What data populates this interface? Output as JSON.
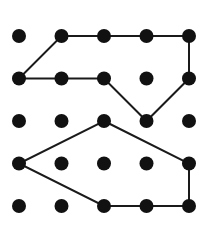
{
  "figure": {
    "type": "dot-grid-polygon-diagram",
    "canvas": {
      "width": 205,
      "height": 236,
      "background_color": "#ffffff"
    },
    "grid": {
      "rows": 5,
      "columns": 5,
      "origin_x": 19,
      "origin_y": 36,
      "spacing_x": 42.5,
      "spacing_y": 42.5,
      "dot_radius": 7,
      "dot_color": "#111111",
      "column_centers": [
        19,
        61.5,
        104,
        146.5,
        189
      ],
      "row_centers": [
        36,
        78.5,
        121,
        163.5,
        206
      ]
    },
    "stroke": {
      "color": "#1a1a1a",
      "width": 2,
      "linejoin": "miter",
      "linecap": "butt"
    },
    "shapes": [
      {
        "name": "upper-polygon",
        "closed": true,
        "fill": "none",
        "vertices_grid": [
          [
            1,
            0
          ],
          [
            4,
            0
          ],
          [
            4,
            1
          ],
          [
            3,
            2
          ],
          [
            2,
            1
          ],
          [
            0,
            1
          ]
        ],
        "vertices_px": [
          [
            61.5,
            36
          ],
          [
            189,
            36
          ],
          [
            189,
            78.5
          ],
          [
            146.5,
            121
          ],
          [
            104,
            78.5
          ],
          [
            19,
            78.5
          ]
        ],
        "vertex_count": 6
      },
      {
        "name": "lower-polygon",
        "closed": true,
        "fill": "none",
        "vertices_grid": [
          [
            2,
            2
          ],
          [
            4,
            3
          ],
          [
            4,
            4
          ],
          [
            2,
            4
          ],
          [
            0,
            3
          ]
        ],
        "vertices_px": [
          [
            104,
            121
          ],
          [
            189,
            163.5
          ],
          [
            189,
            206
          ],
          [
            104,
            206
          ],
          [
            19,
            163.5
          ]
        ],
        "vertex_count": 5
      }
    ],
    "dots": [
      {
        "grid": [
          0,
          0
        ],
        "px": [
          19,
          36
        ]
      },
      {
        "grid": [
          1,
          0
        ],
        "px": [
          61.5,
          36
        ]
      },
      {
        "grid": [
          2,
          0
        ],
        "px": [
          104,
          36
        ]
      },
      {
        "grid": [
          3,
          0
        ],
        "px": [
          146.5,
          36
        ]
      },
      {
        "grid": [
          4,
          0
        ],
        "px": [
          189,
          36
        ]
      },
      {
        "grid": [
          0,
          1
        ],
        "px": [
          19,
          78.5
        ]
      },
      {
        "grid": [
          1,
          1
        ],
        "px": [
          61.5,
          78.5
        ]
      },
      {
        "grid": [
          2,
          1
        ],
        "px": [
          104,
          78.5
        ]
      },
      {
        "grid": [
          3,
          1
        ],
        "px": [
          146.5,
          78.5
        ]
      },
      {
        "grid": [
          4,
          1
        ],
        "px": [
          189,
          78.5
        ]
      },
      {
        "grid": [
          0,
          2
        ],
        "px": [
          19,
          121
        ]
      },
      {
        "grid": [
          1,
          2
        ],
        "px": [
          61.5,
          121
        ]
      },
      {
        "grid": [
          2,
          2
        ],
        "px": [
          104,
          121
        ]
      },
      {
        "grid": [
          3,
          2
        ],
        "px": [
          146.5,
          121
        ]
      },
      {
        "grid": [
          4,
          2
        ],
        "px": [
          189,
          121
        ]
      },
      {
        "grid": [
          0,
          3
        ],
        "px": [
          19,
          163.5
        ]
      },
      {
        "grid": [
          1,
          3
        ],
        "px": [
          61.5,
          163.5
        ]
      },
      {
        "grid": [
          2,
          3
        ],
        "px": [
          104,
          163.5
        ]
      },
      {
        "grid": [
          3,
          3
        ],
        "px": [
          146.5,
          163.5
        ]
      },
      {
        "grid": [
          4,
          3
        ],
        "px": [
          189,
          163.5
        ]
      },
      {
        "grid": [
          0,
          4
        ],
        "px": [
          19,
          206
        ]
      },
      {
        "grid": [
          1,
          4
        ],
        "px": [
          61.5,
          206
        ]
      },
      {
        "grid": [
          2,
          4
        ],
        "px": [
          104,
          206
        ]
      },
      {
        "grid": [
          3,
          4
        ],
        "px": [
          146.5,
          206
        ]
      },
      {
        "grid": [
          4,
          4
        ],
        "px": [
          189,
          206
        ]
      }
    ]
  }
}
